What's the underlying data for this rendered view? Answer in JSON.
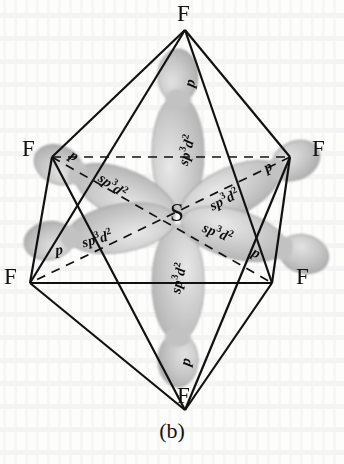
{
  "figure": {
    "caption": "(b)",
    "central_atom": "S",
    "geometry": "octahedral",
    "molecule": "SF6",
    "colors": {
      "orbital_fill": "#c8c8c8",
      "orbital_fill_light": "#dcdcdc",
      "orbital_edge": "#9a9a9a",
      "line": "#111111",
      "text": "#0d0d0d",
      "page": "#fdfdfc"
    },
    "vertices": [
      {
        "id": "f-top",
        "label": "F",
        "x": 185,
        "y": 30,
        "lx": 177,
        "ly": 6
      },
      {
        "id": "f-upper-left",
        "label": "F",
        "x": 52,
        "y": 157,
        "lx": 22,
        "ly": 140
      },
      {
        "id": "f-upper-right",
        "label": "F",
        "x": 290,
        "y": 157,
        "lx": 312,
        "ly": 140
      },
      {
        "id": "f-lower-left",
        "label": "F",
        "x": 30,
        "y": 283,
        "lx": 4,
        "ly": 268
      },
      {
        "id": "f-lower-right",
        "label": "F",
        "x": 272,
        "y": 283,
        "lx": 296,
        "ly": 268
      },
      {
        "id": "f-bottom",
        "label": "F",
        "x": 185,
        "y": 410,
        "lx": 177,
        "ly": 386
      }
    ],
    "center_label": {
      "text": "S",
      "x": 172,
      "y": 204
    },
    "hybrid_label_text": "sp",
    "hybrid_label_sup1": "3",
    "hybrid_label_mid": "d",
    "hybrid_label_sup2": "2",
    "p_label_text": "p",
    "orbitals": [
      {
        "id": "orbital-up",
        "hybrid": "sp3d2",
        "tip": "p",
        "angle": -90,
        "hx": 186,
        "hy": 150,
        "hrot": -76,
        "px": 190,
        "py": 83,
        "prot": -76
      },
      {
        "id": "orbital-down",
        "hybrid": "sp3d2",
        "tip": "p",
        "angle": 90,
        "hx": 178,
        "hy": 278,
        "hrot": -78,
        "px": 186,
        "py": 362,
        "prot": -78
      },
      {
        "id": "orbital-upper-left",
        "hybrid": "sp3d2",
        "tip": "p",
        "angle": -152,
        "hx": 113,
        "hy": 185,
        "hrot": 36,
        "px": 74,
        "py": 156,
        "prot": 32
      },
      {
        "id": "orbital-upper-right",
        "hybrid": "sp3d2",
        "tip": "p",
        "angle": -28,
        "hx": 224,
        "hy": 199,
        "hrot": -26,
        "px": 268,
        "py": 167,
        "prot": -28
      },
      {
        "id": "orbital-lower-left",
        "hybrid": "sp3d2",
        "tip": "p",
        "angle": 166,
        "hx": 97,
        "hy": 238,
        "hrot": -16,
        "px": 59,
        "py": 250,
        "prot": -8
      },
      {
        "id": "orbital-lower-right",
        "hybrid": "sp3d2",
        "tip": "p",
        "angle": 20,
        "hx": 218,
        "hy": 232,
        "hrot": 22,
        "px": 256,
        "py": 253,
        "prot": 26
      }
    ],
    "edges_solid": [
      "f-top to f-upper-left",
      "f-top to f-upper-right",
      "f-top to f-lower-left",
      "f-top to f-lower-right",
      "f-bottom to f-upper-left",
      "f-bottom to f-upper-right",
      "f-bottom to f-lower-left",
      "f-bottom to f-lower-right",
      "f-upper-left to f-lower-left",
      "f-upper-right to f-lower-right",
      "f-lower-left to f-lower-right"
    ],
    "edges_dashed": [
      "f-upper-left to f-upper-right",
      "f-upper-left to f-lower-right",
      "f-upper-right to f-lower-left"
    ]
  }
}
